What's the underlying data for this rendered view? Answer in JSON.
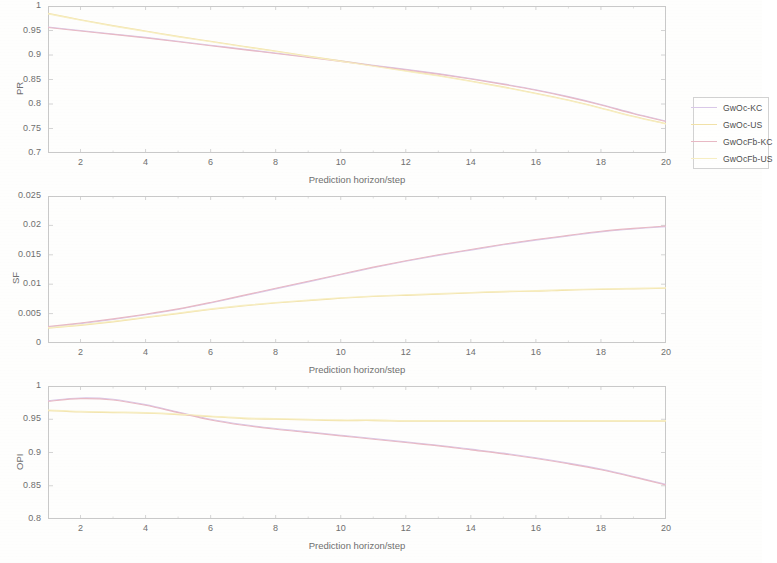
{
  "figure": {
    "background_color": "#fefefd",
    "axis_color": "#c9c9c9",
    "text_color": "#6f6f6f"
  },
  "legend": {
    "entries": [
      {
        "label": "GwOc-KC",
        "color": "#d9c8e8"
      },
      {
        "label": "GwOc-US",
        "color": "#f2e2a8"
      },
      {
        "label": "GwOcFb-KC",
        "color": "#e8b9c4"
      },
      {
        "label": "GwOcFb-US",
        "color": "#f7eec2"
      }
    ]
  },
  "chart_data": [
    {
      "type": "line",
      "title": "",
      "xlabel": "Prediction horizon/step",
      "ylabel": "PR",
      "xlim": [
        1,
        20
      ],
      "ylim": [
        0.7,
        1
      ],
      "xticks": [
        2,
        4,
        6,
        8,
        10,
        12,
        14,
        16,
        18,
        20
      ],
      "xtick_labels": [
        "2",
        "4",
        "6",
        "8",
        "10",
        "12",
        "14",
        "16",
        "18",
        "20"
      ],
      "yticks": [
        0.7,
        0.75,
        0.8,
        0.85,
        0.9,
        0.95,
        1
      ],
      "ytick_labels": [
        "0.7",
        "0.75",
        "0.8",
        "0.85",
        "0.9",
        "0.95",
        "1"
      ],
      "grid": false,
      "legend_position": "outside-right",
      "x": [
        1,
        2,
        3,
        4,
        5,
        6,
        7,
        8,
        9,
        10,
        11,
        12,
        13,
        14,
        15,
        16,
        17,
        18,
        19,
        20
      ],
      "series": [
        {
          "name": "GwOc-KC",
          "color": "#d9c8e8",
          "values": [
            0.957,
            0.95,
            0.943,
            0.936,
            0.928,
            0.92,
            0.912,
            0.904,
            0.896,
            0.888,
            0.879,
            0.871,
            0.862,
            0.852,
            0.841,
            0.829,
            0.815,
            0.799,
            0.781,
            0.765
          ]
        },
        {
          "name": "GwOc-US",
          "color": "#f2e2a8",
          "values": [
            0.985,
            0.972,
            0.96,
            0.949,
            0.938,
            0.928,
            0.918,
            0.908,
            0.898,
            0.888,
            0.878,
            0.868,
            0.858,
            0.847,
            0.835,
            0.822,
            0.808,
            0.792,
            0.775,
            0.76
          ]
        },
        {
          "name": "GwOcFb-KC",
          "color": "#e8b9c4",
          "values": [
            0.956,
            0.949,
            0.942,
            0.935,
            0.927,
            0.919,
            0.911,
            0.903,
            0.895,
            0.887,
            0.878,
            0.87,
            0.861,
            0.851,
            0.84,
            0.828,
            0.814,
            0.798,
            0.78,
            0.764
          ]
        },
        {
          "name": "GwOcFb-US",
          "color": "#f7eec2",
          "values": [
            0.984,
            0.971,
            0.959,
            0.948,
            0.937,
            0.927,
            0.917,
            0.907,
            0.897,
            0.887,
            0.877,
            0.867,
            0.857,
            0.846,
            0.834,
            0.821,
            0.807,
            0.791,
            0.774,
            0.759
          ]
        }
      ]
    },
    {
      "type": "line",
      "title": "",
      "xlabel": "Prediction horizon/step",
      "ylabel": "SF",
      "xlim": [
        1,
        20
      ],
      "ylim": [
        0,
        0.025
      ],
      "xticks": [
        2,
        4,
        6,
        8,
        10,
        12,
        14,
        16,
        18,
        20
      ],
      "xtick_labels": [
        "2",
        "4",
        "6",
        "8",
        "10",
        "12",
        "14",
        "16",
        "18",
        "20"
      ],
      "yticks": [
        0,
        0.005,
        0.01,
        0.015,
        0.02,
        0.025
      ],
      "ytick_labels": [
        "0",
        "0.005",
        "0.01",
        "0.015",
        "0.02",
        "0.025"
      ],
      "grid": false,
      "legend_position": "outside-right",
      "x": [
        1,
        2,
        3,
        4,
        5,
        6,
        7,
        8,
        9,
        10,
        11,
        12,
        13,
        14,
        15,
        16,
        17,
        18,
        19,
        20
      ],
      "series": [
        {
          "name": "GwOc-KC",
          "color": "#d9c8e8",
          "values": [
            0.0027,
            0.0033,
            0.004,
            0.0048,
            0.0057,
            0.0068,
            0.008,
            0.0092,
            0.0104,
            0.0116,
            0.0128,
            0.0139,
            0.0149,
            0.0158,
            0.0167,
            0.0175,
            0.0182,
            0.0189,
            0.0194,
            0.0198
          ]
        },
        {
          "name": "GwOc-US",
          "color": "#f2e2a8",
          "values": [
            0.0025,
            0.003,
            0.0036,
            0.0043,
            0.005,
            0.0057,
            0.0063,
            0.0068,
            0.0072,
            0.0076,
            0.0079,
            0.0081,
            0.0083,
            0.0085,
            0.0087,
            0.0088,
            0.009,
            0.0091,
            0.0092,
            0.0093
          ]
        },
        {
          "name": "GwOcFb-KC",
          "color": "#e8b9c4",
          "values": [
            0.0028,
            0.0034,
            0.0041,
            0.0049,
            0.0058,
            0.0069,
            0.0081,
            0.0093,
            0.0105,
            0.0117,
            0.0129,
            0.014,
            0.015,
            0.0159,
            0.0168,
            0.0176,
            0.0183,
            0.019,
            0.0195,
            0.0199
          ]
        },
        {
          "name": "GwOcFb-US",
          "color": "#f7eec2",
          "values": [
            0.0026,
            0.0031,
            0.0037,
            0.0044,
            0.0051,
            0.0058,
            0.0064,
            0.0069,
            0.0073,
            0.0077,
            0.008,
            0.0082,
            0.0084,
            0.0086,
            0.0088,
            0.0089,
            0.0091,
            0.0092,
            0.0093,
            0.0094
          ]
        }
      ]
    },
    {
      "type": "line",
      "title": "",
      "xlabel": "Prediction horizon/step",
      "ylabel": "OPI",
      "xlim": [
        1,
        20
      ],
      "ylim": [
        0.8,
        1
      ],
      "xticks": [
        2,
        4,
        6,
        8,
        10,
        12,
        14,
        16,
        18,
        20
      ],
      "xtick_labels": [
        "2",
        "4",
        "6",
        "8",
        "10",
        "12",
        "14",
        "16",
        "18",
        "20"
      ],
      "yticks": [
        0.8,
        0.85,
        0.9,
        0.95,
        1
      ],
      "ytick_labels": [
        "0.8",
        "0.85",
        "0.9",
        "0.95",
        "1"
      ],
      "grid": false,
      "legend_position": "outside-right",
      "x": [
        1,
        2,
        3,
        4,
        5,
        6,
        7,
        8,
        9,
        10,
        11,
        12,
        13,
        14,
        15,
        16,
        17,
        18,
        19,
        20
      ],
      "series": [
        {
          "name": "GwOc-KC",
          "color": "#d9c8e8",
          "values": [
            0.978,
            0.982,
            0.98,
            0.972,
            0.961,
            0.95,
            0.942,
            0.936,
            0.931,
            0.926,
            0.921,
            0.916,
            0.911,
            0.905,
            0.899,
            0.892,
            0.884,
            0.875,
            0.864,
            0.852
          ]
        },
        {
          "name": "GwOc-US",
          "color": "#f2e2a8",
          "values": [
            0.963,
            0.961,
            0.96,
            0.959,
            0.957,
            0.954,
            0.951,
            0.95,
            0.949,
            0.948,
            0.948,
            0.947,
            0.947,
            0.947,
            0.947,
            0.947,
            0.947,
            0.947,
            0.947,
            0.947
          ]
        },
        {
          "name": "GwOcFb-KC",
          "color": "#e8b9c4",
          "values": [
            0.977,
            0.981,
            0.979,
            0.971,
            0.96,
            0.949,
            0.941,
            0.935,
            0.93,
            0.925,
            0.92,
            0.915,
            0.91,
            0.904,
            0.898,
            0.891,
            0.883,
            0.874,
            0.863,
            0.851
          ]
        },
        {
          "name": "GwOcFb-US",
          "color": "#f7eec2",
          "values": [
            0.964,
            0.962,
            0.961,
            0.96,
            0.958,
            0.955,
            0.952,
            0.951,
            0.95,
            0.949,
            0.949,
            0.948,
            0.948,
            0.948,
            0.948,
            0.948,
            0.948,
            0.948,
            0.948,
            0.948
          ]
        }
      ]
    }
  ]
}
